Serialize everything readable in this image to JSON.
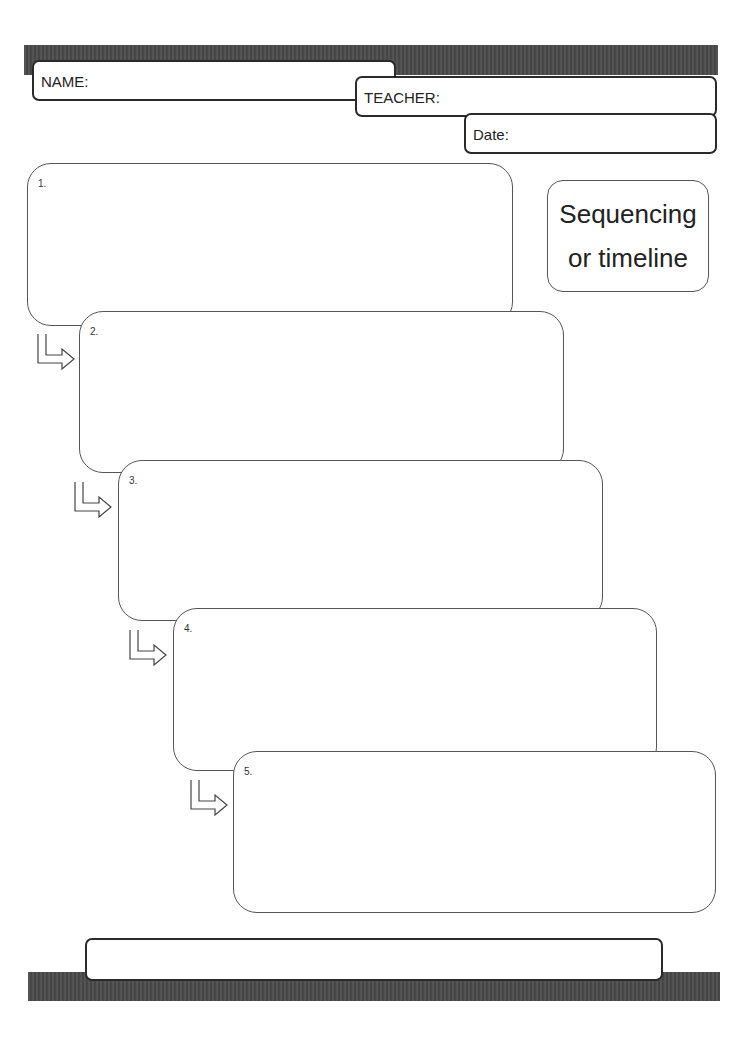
{
  "header": {
    "name_label": "NAME:",
    "teacher_label": "TEACHER:",
    "date_label": "Date:"
  },
  "title": {
    "line1": "Sequencing",
    "line2": "or timeline"
  },
  "steps": [
    {
      "number": "1."
    },
    {
      "number": "2."
    },
    {
      "number": "3."
    },
    {
      "number": "4."
    },
    {
      "number": "5."
    }
  ],
  "footer": {
    "text": ""
  },
  "colors": {
    "bar": "#4a4a4a",
    "border": "#555555",
    "text": "#222222"
  },
  "icons": {
    "arrow": "down-right-turn-arrow-icon"
  }
}
